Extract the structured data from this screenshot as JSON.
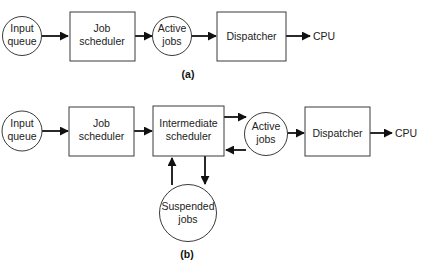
{
  "diagrams": {
    "a": {
      "caption": "(a)",
      "nodes": {
        "input_queue": {
          "shape": "circle",
          "lines": [
            "Input",
            "queue"
          ]
        },
        "job_scheduler": {
          "shape": "box",
          "lines": [
            "Job",
            "scheduler"
          ]
        },
        "active_jobs": {
          "shape": "circle",
          "lines": [
            "Active",
            "jobs"
          ]
        },
        "dispatcher": {
          "shape": "box",
          "lines": [
            "Dispatcher"
          ]
        },
        "cpu": {
          "shape": "terminal",
          "lines": [
            "CPU"
          ]
        }
      },
      "edges": [
        {
          "from": "input_queue",
          "to": "job_scheduler"
        },
        {
          "from": "job_scheduler",
          "to": "active_jobs"
        },
        {
          "from": "active_jobs",
          "to": "dispatcher"
        },
        {
          "from": "dispatcher",
          "to": "cpu"
        }
      ]
    },
    "b": {
      "caption": "(b)",
      "nodes": {
        "input_queue": {
          "shape": "circle",
          "lines": [
            "Input",
            "queue"
          ]
        },
        "job_scheduler": {
          "shape": "box",
          "lines": [
            "Job",
            "scheduler"
          ]
        },
        "intermediate_scheduler": {
          "shape": "box",
          "lines": [
            "Intermediate",
            "scheduler"
          ]
        },
        "active_jobs": {
          "shape": "circle",
          "lines": [
            "Active",
            "jobs"
          ]
        },
        "dispatcher": {
          "shape": "box",
          "lines": [
            "Dispatcher"
          ]
        },
        "cpu": {
          "shape": "terminal",
          "lines": [
            "CPU"
          ]
        },
        "suspended_jobs": {
          "shape": "circle",
          "lines": [
            "Suspended",
            "jobs"
          ]
        }
      },
      "edges": [
        {
          "from": "input_queue",
          "to": "job_scheduler"
        },
        {
          "from": "job_scheduler",
          "to": "intermediate_scheduler"
        },
        {
          "from": "intermediate_scheduler",
          "to": "active_jobs"
        },
        {
          "from": "active_jobs",
          "to": "intermediate_scheduler"
        },
        {
          "from": "active_jobs",
          "to": "dispatcher"
        },
        {
          "from": "dispatcher",
          "to": "cpu"
        },
        {
          "from": "intermediate_scheduler",
          "to": "suspended_jobs"
        },
        {
          "from": "suspended_jobs",
          "to": "intermediate_scheduler"
        }
      ]
    }
  }
}
